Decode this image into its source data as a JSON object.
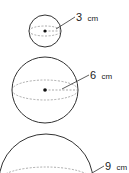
{
  "diagram": {
    "type": "spheres-with-radius",
    "stroke_color": "#333333",
    "dash_color": "#888888",
    "spheres": [
      {
        "id": "small",
        "radius_value": "3",
        "unit": "cm"
      },
      {
        "id": "medium",
        "radius_value": "6",
        "unit": "cm"
      },
      {
        "id": "large",
        "radius_value": "9",
        "unit": "cm"
      }
    ]
  }
}
